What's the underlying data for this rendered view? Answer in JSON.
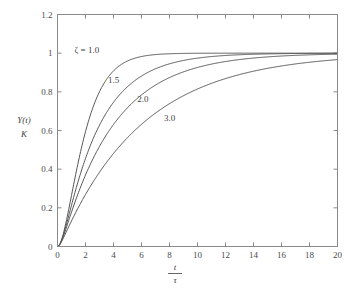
{
  "chart_data": {
    "type": "line",
    "title": "",
    "xlabel": "t/τ",
    "xlabel_num": "t",
    "xlabel_den": "τ",
    "ylabel": "Y(t)/K",
    "ylabel_num": "Y(t)",
    "ylabel_den": "K",
    "xlim": [
      0,
      20
    ],
    "ylim": [
      0,
      1.2
    ],
    "grid": false,
    "legend_position": "inline-annotations",
    "xticks": [
      0,
      2,
      4,
      6,
      8,
      10,
      12,
      14,
      16,
      18,
      20
    ],
    "xticklabels": [
      "0",
      "2",
      "4",
      "6",
      "8",
      "10",
      "12",
      "14",
      "16",
      "18",
      "20"
    ],
    "yticks": [
      0,
      0.2,
      0.4,
      0.6,
      0.8,
      1,
      1.2
    ],
    "yticklabels": [
      "0",
      "0.2",
      "0.4",
      "0.6",
      "0.8",
      "1",
      "1.2"
    ],
    "x": [
      0,
      0.25,
      0.5,
      0.75,
      1,
      1.5,
      2,
      2.5,
      3,
      3.5,
      4,
      4.5,
      5,
      6,
      7,
      8,
      9,
      10,
      11,
      12,
      13,
      14,
      15,
      16,
      17,
      18,
      19,
      20
    ],
    "series": [
      {
        "name": "ζ = 1.0",
        "label": "ζ = 1.0",
        "zeta": 1.0,
        "color": "#555555",
        "label_x": 2.1,
        "label_y": 1.0,
        "values": [
          0,
          0.0265,
          0.0902,
          0.1734,
          0.2642,
          0.4422,
          0.594,
          0.7127,
          0.8009,
          0.8641,
          0.9084,
          0.9389,
          0.9596,
          0.9826,
          0.9927,
          0.997,
          0.9988,
          0.9995,
          0.9998,
          0.9999,
          1.0,
          1.0,
          1.0,
          1.0,
          1.0,
          1.0,
          1.0,
          1.0
        ]
      },
      {
        "name": "1.5",
        "label": "1.5",
        "zeta": 1.5,
        "color": "#555555",
        "label_x": 4.0,
        "label_y": 0.845,
        "values": [
          0,
          0.0114,
          0.042,
          0.0864,
          0.1402,
          0.2634,
          0.3892,
          0.5049,
          0.6048,
          0.6875,
          0.754,
          0.8066,
          0.8475,
          0.9034,
          0.9372,
          0.958,
          0.9722,
          0.9815,
          0.9878,
          0.9919,
          0.9946,
          0.9964,
          0.9976,
          0.9984,
          0.9989,
          0.9993,
          0.9995,
          0.9997
        ]
      },
      {
        "name": "2.0",
        "label": "2.0",
        "zeta": 2.0,
        "color": "#555555",
        "label_x": 6.1,
        "label_y": 0.745,
        "values": [
          0,
          0.0067,
          0.0254,
          0.0537,
          0.0896,
          0.1768,
          0.2735,
          0.3697,
          0.46,
          0.5417,
          0.6137,
          0.6759,
          0.729,
          0.8106,
          0.8668,
          0.9071,
          0.935,
          0.9546,
          0.9684,
          0.978,
          0.9847,
          0.9894,
          0.9927,
          0.995,
          0.9965,
          0.9976,
          0.9984,
          0.9989
        ]
      },
      {
        "name": "3.0",
        "label": "3.0",
        "zeta": 3.0,
        "color": "#555555",
        "label_x": 8.0,
        "label_y": 0.65,
        "values": [
          0,
          0.0035,
          0.0134,
          0.029,
          0.0492,
          0.1003,
          0.1606,
          0.225,
          0.2902,
          0.3539,
          0.4146,
          0.4716,
          0.5245,
          0.6176,
          0.6947,
          0.7577,
          0.8087,
          0.85,
          0.8833,
          0.9101,
          0.9317,
          0.949,
          0.9629,
          0.9741,
          0.982,
          0.9872,
          0.991,
          0.994
        ]
      }
    ]
  }
}
